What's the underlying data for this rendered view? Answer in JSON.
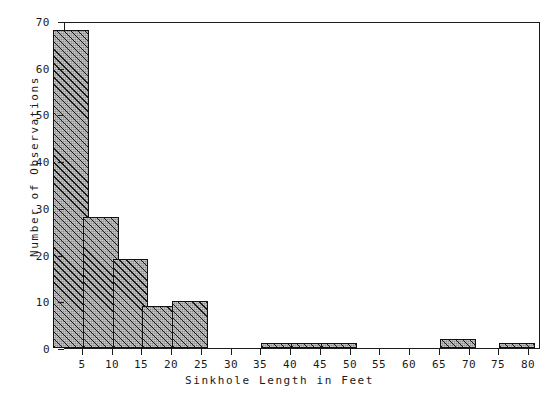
{
  "chart_data": {
    "type": "bar",
    "title": "",
    "xlabel": "Sinkhole Length in Feet",
    "ylabel": "Number of Observations",
    "categories": [
      5,
      10,
      15,
      20,
      25,
      30,
      35,
      40,
      45,
      50,
      55,
      60,
      65,
      70,
      75,
      80
    ],
    "values": [
      68,
      28,
      19,
      9,
      10,
      0,
      0,
      1,
      1,
      1,
      0,
      0,
      0,
      2,
      0,
      1
    ],
    "bin_width": 5,
    "xlim": [
      2,
      82
    ],
    "ylim": [
      0,
      70
    ],
    "xticks": [
      5,
      10,
      15,
      20,
      25,
      30,
      35,
      40,
      45,
      50,
      55,
      60,
      65,
      70,
      75,
      80
    ],
    "yticks": [
      0,
      10,
      20,
      30,
      40,
      50,
      60,
      70
    ],
    "xtick_labels": [
      "5",
      "10",
      "15",
      "20",
      "25",
      "30",
      "35",
      "40",
      "45",
      "50",
      "55",
      "60",
      "65",
      "70",
      "75",
      "80"
    ],
    "ytick_labels": [
      "0",
      "10",
      "20",
      "30",
      "40",
      "50",
      "60",
      "70"
    ],
    "grid": false,
    "legend": null,
    "legend_position": "none",
    "bar_fill_color": "#8e8e8e",
    "bar_edge_color": "#111111",
    "bar_hatch": "diagonal-crosshatch",
    "axes_color": "#1c1c1c",
    "background_color": "#ffffff",
    "series": [
      {
        "name": "Sinkhole length frequency",
        "values": [
          68,
          28,
          19,
          9,
          10,
          0,
          0,
          1,
          1,
          1,
          0,
          0,
          0,
          2,
          0,
          1
        ]
      }
    ]
  }
}
